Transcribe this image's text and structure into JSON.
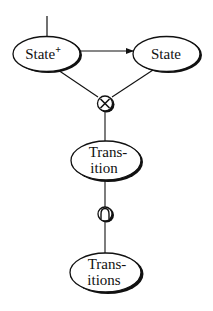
{
  "diagram": {
    "type": "flow",
    "colors": {
      "background": "#ffffff",
      "stroke": "#111111",
      "shadow": "#111111",
      "node_fill": "#ffffff"
    },
    "nodes": [
      {
        "id": "state_plus",
        "label": "State",
        "superscript": "+",
        "shape": "ellipse"
      },
      {
        "id": "state",
        "label": "State",
        "shape": "ellipse"
      },
      {
        "id": "product_op",
        "symbol": "⊗",
        "meaning": "cross-product operator",
        "shape": "circle"
      },
      {
        "id": "transition",
        "label_line1": "Trans-",
        "label_line2": "ition",
        "shape": "ellipse"
      },
      {
        "id": "intersection_op",
        "symbol": "∩",
        "meaning": "intersection operator",
        "shape": "circle"
      },
      {
        "id": "transitions",
        "label_line1": "Trans-",
        "label_line2": "itions",
        "shape": "ellipse"
      }
    ],
    "edges": [
      {
        "from": "top",
        "to": "state_plus",
        "style": "line"
      },
      {
        "from": "state_plus",
        "to": "state",
        "style": "arrow"
      },
      {
        "from": "state_plus",
        "to": "product_op",
        "style": "line"
      },
      {
        "from": "state",
        "to": "product_op",
        "style": "line"
      },
      {
        "from": "product_op",
        "to": "transition",
        "style": "line"
      },
      {
        "from": "transition",
        "to": "intersection_op",
        "style": "line"
      },
      {
        "from": "intersection_op",
        "to": "transitions",
        "style": "line"
      }
    ]
  }
}
